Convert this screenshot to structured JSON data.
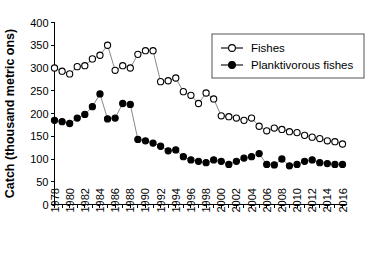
{
  "chart_data": {
    "type": "line",
    "title": "",
    "xlabel": "",
    "ylabel": "Catch (thousand metric ons)",
    "ylim": [
      0,
      400
    ],
    "ytick_values": [
      0,
      50,
      100,
      150,
      200,
      250,
      300,
      350,
      400
    ],
    "ytick_labels": [
      "0",
      "50",
      "100",
      "150",
      "200",
      "250",
      "300",
      "350",
      "400"
    ],
    "xlim": [
      1978,
      2016
    ],
    "x": [
      1978,
      1979,
      1980,
      1981,
      1982,
      1983,
      1984,
      1985,
      1986,
      1987,
      1988,
      1989,
      1990,
      1991,
      1992,
      1993,
      1994,
      1995,
      1996,
      1997,
      1998,
      1999,
      2000,
      2001,
      2002,
      2003,
      2004,
      2005,
      2006,
      2007,
      2008,
      2009,
      2010,
      2011,
      2012,
      2013,
      2014,
      2015,
      2016
    ],
    "xtick_labels": [
      "1978",
      "1980",
      "1982",
      "1984",
      "1986",
      "1988",
      "1990",
      "1992",
      "1994",
      "1996",
      "1998",
      "2000",
      "2002",
      "2004",
      "2006",
      "2008",
      "2010",
      "2012",
      "2014",
      "2016"
    ],
    "xtick_values": [
      1978,
      1980,
      1982,
      1984,
      1986,
      1988,
      1990,
      1992,
      1994,
      1996,
      1998,
      2000,
      2002,
      2004,
      2006,
      2008,
      2010,
      2012,
      2014,
      2016
    ],
    "grid": false,
    "legend_position": "top-right",
    "series": [
      {
        "name": "Fishes",
        "marker": "open-circle",
        "color": "#000000",
        "values": [
          300,
          293,
          287,
          303,
          305,
          320,
          328,
          350,
          295,
          305,
          300,
          330,
          338,
          338,
          270,
          272,
          278,
          248,
          240,
          222,
          245,
          232,
          195,
          193,
          190,
          185,
          190,
          172,
          162,
          168,
          165,
          160,
          158,
          152,
          148,
          145,
          140,
          138,
          133
        ]
      },
      {
        "name": "Planktivorous fishes",
        "marker": "filled-circle",
        "color": "#000000",
        "values": [
          185,
          182,
          178,
          190,
          198,
          215,
          243,
          188,
          190,
          222,
          220,
          143,
          140,
          135,
          128,
          118,
          120,
          105,
          98,
          95,
          92,
          98,
          95,
          88,
          95,
          102,
          105,
          112,
          88,
          87,
          100,
          85,
          88,
          95,
          98,
          92,
          90,
          88,
          88
        ]
      }
    ]
  },
  "legend": {
    "entries": [
      {
        "label": "Fishes"
      },
      {
        "label": "Planktivorous fishes"
      }
    ]
  }
}
